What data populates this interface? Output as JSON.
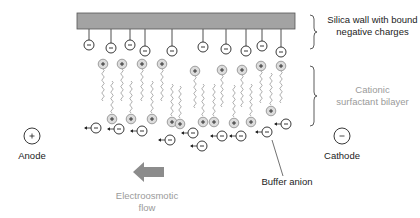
{
  "labels": {
    "silica_wall": [
      "Silica wall with bound",
      "negative charges"
    ],
    "surfactant": [
      "Cationic",
      "surfactant bilayer"
    ],
    "anode": "Anode",
    "cathode": "Cathode",
    "buffer_anion": "Buffer anion",
    "eof": [
      "Electroosmotic",
      "flow"
    ]
  },
  "symbols": {
    "plus": "+",
    "minus": "−"
  },
  "colors": {
    "wall_fill": "#a3a3a3",
    "wall_stroke": "#555555",
    "ink": "#222222",
    "cation_fill": "#dcdcdc",
    "cation_stroke": "#8a8a8a",
    "tail": "#8a8a8a",
    "eof_arrow": "#8c8c8c",
    "light_text": "#9a9a9a"
  },
  "wall": {
    "x": 77,
    "y": 13,
    "w": 218,
    "h": 16
  },
  "bound_charges": [
    {
      "x": 89,
      "y": 45
    },
    {
      "x": 111,
      "y": 48
    },
    {
      "x": 130,
      "y": 45
    },
    {
      "x": 145,
      "y": 51
    },
    {
      "x": 172,
      "y": 51
    },
    {
      "x": 203,
      "y": 47
    },
    {
      "x": 226,
      "y": 49
    },
    {
      "x": 246,
      "y": 51
    },
    {
      "x": 262,
      "y": 46
    },
    {
      "x": 281,
      "y": 52
    }
  ],
  "top_cations": [
    {
      "x": 103,
      "y": 64
    },
    {
      "x": 122,
      "y": 64
    },
    {
      "x": 142,
      "y": 64
    },
    {
      "x": 162,
      "y": 64
    },
    {
      "x": 195,
      "y": 71
    },
    {
      "x": 222,
      "y": 70
    },
    {
      "x": 242,
      "y": 70
    },
    {
      "x": 261,
      "y": 66
    },
    {
      "x": 281,
      "y": 66
    }
  ],
  "bottom_cations": [
    {
      "x": 112,
      "y": 119
    },
    {
      "x": 131,
      "y": 119
    },
    {
      "x": 152,
      "y": 119
    },
    {
      "x": 172,
      "y": 122
    },
    {
      "x": 180,
      "y": 124
    },
    {
      "x": 203,
      "y": 122
    },
    {
      "x": 214,
      "y": 122
    },
    {
      "x": 234,
      "y": 123
    },
    {
      "x": 251,
      "y": 122
    },
    {
      "x": 271,
      "y": 111
    }
  ],
  "free_anions": [
    {
      "x": 96,
      "y": 128
    },
    {
      "x": 119,
      "y": 129
    },
    {
      "x": 142,
      "y": 131
    },
    {
      "x": 170,
      "y": 140
    },
    {
      "x": 193,
      "y": 133
    },
    {
      "x": 202,
      "y": 146
    },
    {
      "x": 222,
      "y": 136
    },
    {
      "x": 241,
      "y": 136
    },
    {
      "x": 267,
      "y": 132
    },
    {
      "x": 286,
      "y": 124
    }
  ],
  "electrodes": {
    "anode": {
      "x": 32,
      "y": 136
    },
    "cathode": {
      "x": 342,
      "y": 136
    }
  }
}
